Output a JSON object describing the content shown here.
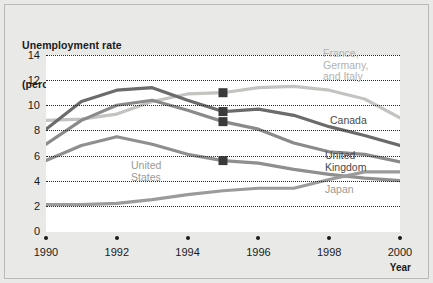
{
  "chart_data": {
    "type": "line",
    "title": "Unemployment rate\n(percentage of labour force)",
    "title_line1": "Unemployment rate",
    "title_line2": "(percentage of labour force)",
    "xlabel": "Year",
    "ylabel": "",
    "xlim": [
      1990,
      2000
    ],
    "ylim": [
      0,
      14
    ],
    "grid": true,
    "legend_position": "inline-labels",
    "yticks": [
      "14",
      "12",
      "10",
      "8",
      "6",
      "4",
      "2",
      "0"
    ],
    "ytick_values": [
      14,
      12,
      10,
      8,
      6,
      4,
      2,
      0
    ],
    "xticks": [
      "1990",
      "1992",
      "1994",
      "1996",
      "1998",
      "2000"
    ],
    "xtick_values": [
      1990,
      1992,
      1994,
      1996,
      1998,
      2000
    ],
    "x": [
      1990,
      1991,
      1992,
      1993,
      1994,
      1995,
      1996,
      1997,
      1998,
      1999,
      2000
    ],
    "series": [
      {
        "name": "France, Germany, and Italy",
        "label": "France,\nGermany,\nand Italy",
        "color": "#c3c3c0",
        "label_color": "#b2b2ae",
        "values": [
          8.8,
          8.9,
          9.3,
          10.3,
          10.9,
          11.0,
          11.4,
          11.5,
          11.2,
          10.5,
          9.0
        ]
      },
      {
        "name": "Canada",
        "label": "Canada",
        "color": "#6b6b6b",
        "label_color": "#4a4a4a",
        "values": [
          8.1,
          10.3,
          11.2,
          11.4,
          10.4,
          9.5,
          9.7,
          9.2,
          8.3,
          7.6,
          6.8
        ]
      },
      {
        "name": "United Kingdom",
        "label": "United\nKingdom",
        "color": "#8a8a8a",
        "label_color": "#4a4a4a",
        "values": [
          6.9,
          8.8,
          10.0,
          10.4,
          9.6,
          8.7,
          8.1,
          7.0,
          6.3,
          6.1,
          5.5
        ]
      },
      {
        "name": "United States",
        "label": "United\nStates",
        "color": "#8f8f8f",
        "label_color": "#9a9a96",
        "values": [
          5.6,
          6.8,
          7.5,
          6.9,
          6.1,
          5.6,
          5.4,
          4.9,
          4.5,
          4.2,
          4.0
        ]
      },
      {
        "name": "Japan",
        "label": "Japan",
        "color": "#9b9b9b",
        "label_color": "#9a9a96",
        "values": [
          2.1,
          2.1,
          2.2,
          2.5,
          2.9,
          3.2,
          3.4,
          3.4,
          4.1,
          4.7,
          4.7
        ]
      }
    ],
    "markers": [
      {
        "series": "France, Germany, and Italy",
        "x": 1995,
        "y": 11.0
      },
      {
        "series": "Canada",
        "x": 1995,
        "y": 9.5
      },
      {
        "series": "United Kingdom",
        "x": 1995,
        "y": 8.7
      },
      {
        "series": "United States",
        "x": 1995,
        "y": 5.6
      }
    ]
  }
}
